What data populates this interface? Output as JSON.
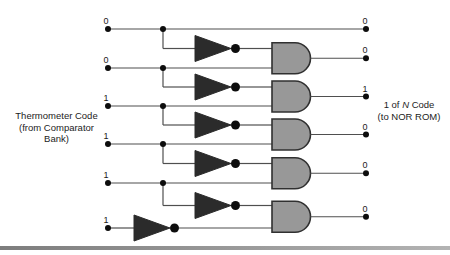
{
  "diagram": {
    "left_label": {
      "line1": "Thermometer Code",
      "line2": "(from Comparator",
      "line3": "Bank)"
    },
    "right_label": {
      "line1_pre": "1 of",
      "line1_n": "N",
      "line1_post": "Code",
      "line2": "(to NOR ROM)"
    },
    "input_bits": [
      "0",
      "0",
      "1",
      "1",
      "1",
      "1"
    ],
    "output_bits": [
      "0",
      "0",
      "1",
      "0",
      "0",
      "0"
    ],
    "row_y": [
      29,
      68,
      106,
      144,
      183,
      228
    ],
    "colors": {
      "wire": "#4f4f4f",
      "dot": "#0d0d0d",
      "inverter_fill": "#2b2b2b",
      "gate_fill": "#989898",
      "gate_stroke": "#303030",
      "text": "#1a1a1a",
      "bottom_rule_left": "#7d7d7d",
      "bottom_rule_right": "#b3b3b3"
    }
  }
}
